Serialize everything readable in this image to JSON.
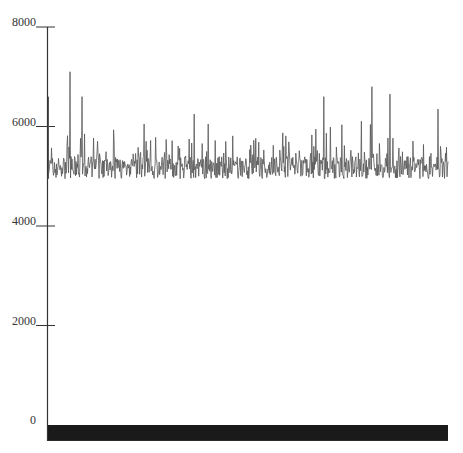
{
  "chart_data": {
    "type": "line",
    "title": "",
    "xlabel": "",
    "ylabel": "",
    "ylim": [
      0,
      8000
    ],
    "yticks": [
      0,
      2000,
      4000,
      6000,
      8000
    ],
    "ytick_labels": [
      "0",
      "2000",
      "4000",
      "6000",
      "8000"
    ],
    "grid": false,
    "legend": null,
    "series": [
      {
        "name": "signal",
        "color": "#555555",
        "description": "noisy series fluctuating around ~5200 with baseline ~4950 and spikes up to ~7100",
        "baseline": 4950,
        "peaks": [
          {
            "x_frac": 0.055,
            "value": 7100
          },
          {
            "x_frac": 0.085,
            "value": 6600
          },
          {
            "x_frac": 0.365,
            "value": 6250
          },
          {
            "x_frac": 0.69,
            "value": 6600
          },
          {
            "x_frac": 0.81,
            "value": 6800
          },
          {
            "x_frac": 0.855,
            "value": 6650
          },
          {
            "x_frac": 0.975,
            "value": 6350
          }
        ],
        "n_points": 800,
        "seed": 7
      },
      {
        "name": "near-zero band",
        "color": "#1a1a1a",
        "description": "dense series at/below zero rendered as a solid dark band",
        "range": [
          -320,
          0
        ]
      }
    ]
  }
}
